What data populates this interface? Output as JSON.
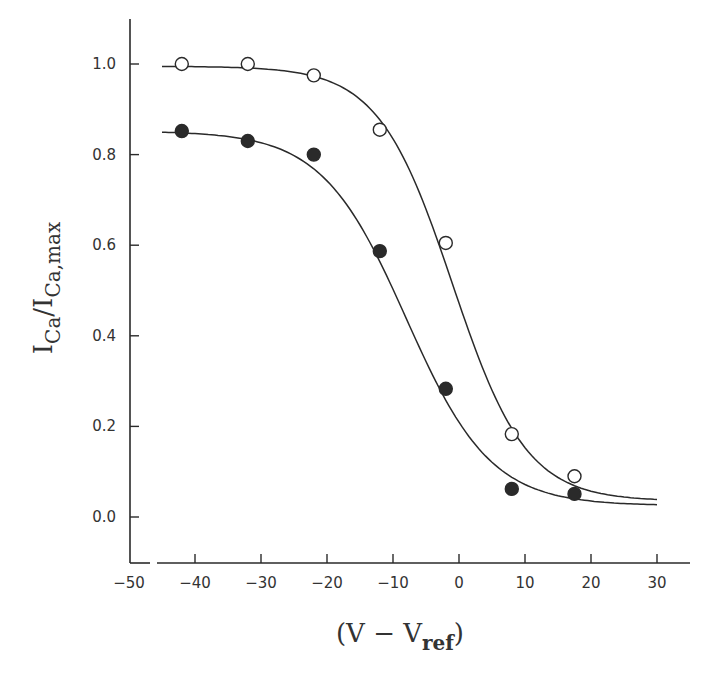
{
  "chart_data": {
    "type": "scatter",
    "title": "",
    "xlabel": "(V − V_ref)",
    "xlabel_parts": {
      "pre": "(V  −  V",
      "sub": "ref",
      "post": ")"
    },
    "ylabel": "I_Ca/I_Ca,max",
    "ylabel_parts": {
      "a": "I",
      "a_sub": "Ca",
      "slash": "/",
      "b": "I",
      "b_sub": "Ca,max"
    },
    "xlim": [
      -50,
      35
    ],
    "ylim": [
      -0.1,
      1.1
    ],
    "x_ticks": [
      -50,
      -40,
      -30,
      -20,
      -10,
      0,
      10,
      20,
      30
    ],
    "x_tick_labels": [
      "−50",
      "−40",
      "−30",
      "−20",
      "−10",
      "0",
      "10",
      "20",
      "30"
    ],
    "y_ticks": [
      0.0,
      0.2,
      0.4,
      0.6,
      0.8,
      1.0
    ],
    "y_tick_labels": [
      "0.0",
      "0.2",
      "0.4",
      "0.6",
      "0.8",
      "1.0"
    ],
    "grid": false,
    "legend": null,
    "series": [
      {
        "name": "open circles",
        "marker": "open-circle",
        "x": [
          -42,
          -32,
          -22,
          -12,
          -2,
          8,
          17.5
        ],
        "y": [
          1.0,
          1.0,
          0.975,
          0.855,
          0.605,
          0.183,
          0.09
        ],
        "fit": {
          "type": "boltzmann",
          "top": 0.995,
          "bottom": 0.035,
          "v_half": -1.0,
          "k": 5.6,
          "x_range": [
            -45,
            30
          ]
        }
      },
      {
        "name": "filled circles",
        "marker": "filled-circle",
        "x": [
          -42,
          -32,
          -22,
          -12,
          -2,
          8,
          17.5
        ],
        "y": [
          0.852,
          0.83,
          0.8,
          0.587,
          0.283,
          0.062,
          0.051
        ],
        "fit": {
          "type": "boltzmann",
          "top": 0.852,
          "bottom": 0.025,
          "v_half": -8.0,
          "k": 6.4,
          "x_range": [
            -45,
            30
          ]
        }
      }
    ]
  },
  "style": {
    "ink": "#2a2a2a",
    "background": "#ffffff"
  }
}
